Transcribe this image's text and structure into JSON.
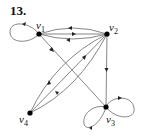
{
  "problem_number": "13.",
  "graph": {
    "type": "directed",
    "vertices": [
      {
        "id": "v1",
        "name": "v",
        "sub": "1",
        "x": 39,
        "y": 34
      },
      {
        "id": "v2",
        "name": "v",
        "sub": "2",
        "x": 107,
        "y": 34
      },
      {
        "id": "v3",
        "name": "v",
        "sub": "3",
        "x": 106,
        "y": 107
      },
      {
        "id": "v4",
        "name": "v",
        "sub": "4",
        "x": 30,
        "y": 113
      }
    ],
    "edges": [
      {
        "from": "v1",
        "to": "v1",
        "kind": "loop"
      },
      {
        "from": "v2",
        "to": "v1",
        "kind": "arc-upper"
      },
      {
        "from": "v1",
        "to": "v2",
        "kind": "straight"
      },
      {
        "from": "v2",
        "to": "v1",
        "kind": "arc-lower"
      },
      {
        "from": "v2",
        "to": "v3",
        "kind": "straight"
      },
      {
        "from": "v1",
        "to": "v3",
        "kind": "straight"
      },
      {
        "from": "v4",
        "to": "v2",
        "kind": "arc-upper"
      },
      {
        "from": "v2",
        "to": "v4",
        "kind": "straight"
      },
      {
        "from": "v2",
        "to": "v4",
        "kind": "arc-lower"
      },
      {
        "from": "v3",
        "to": "v3",
        "kind": "loop-left"
      },
      {
        "from": "v3",
        "to": "v3",
        "kind": "loop-right"
      }
    ]
  }
}
